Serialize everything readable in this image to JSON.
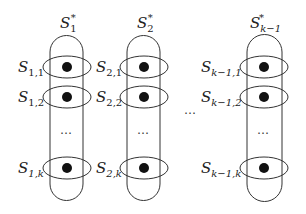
{
  "diagram": {
    "columns": [
      {
        "top_label": {
          "base": "S",
          "sub": "1",
          "sup": "*"
        },
        "rows": [
          {
            "base": "S",
            "sub": "1,1"
          },
          {
            "base": "S",
            "sub": "1,2"
          },
          {
            "base": "S",
            "sub": "1,k"
          }
        ],
        "ellipsis": "…"
      },
      {
        "top_label": {
          "base": "S",
          "sub": "2",
          "sup": "*"
        },
        "rows": [
          {
            "base": "S",
            "sub": "2,1"
          },
          {
            "base": "S",
            "sub": "2,2"
          },
          {
            "base": "S",
            "sub": "2,k"
          }
        ],
        "ellipsis": "…"
      },
      {
        "top_label": {
          "base": "S",
          "sub": "k−1",
          "sup": "*"
        },
        "rows": [
          {
            "base": "S",
            "sub": "k−1,1"
          },
          {
            "base": "S",
            "sub": "k−1,2"
          },
          {
            "base": "S",
            "sub": "k−1,k"
          }
        ],
        "ellipsis": "…"
      }
    ],
    "between_ellipsis": "…",
    "colors": {
      "stroke": "#333333",
      "dot": "#111111",
      "background": "#ffffff"
    }
  }
}
